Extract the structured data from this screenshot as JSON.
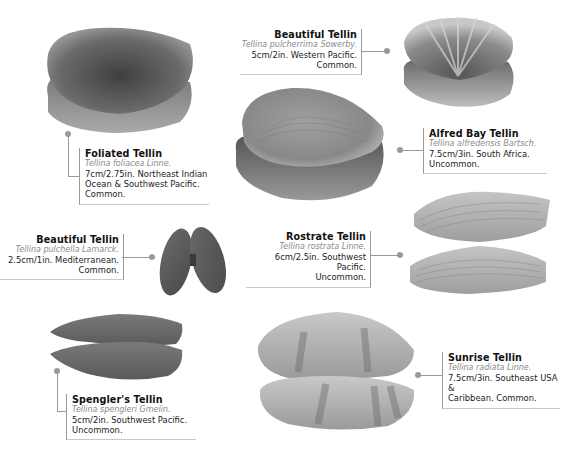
{
  "shells": [
    {
      "id": "foliated-tellin",
      "name": "Foliated Tellin",
      "latin": "Tellina foliacea Linne.",
      "desc_lines": [
        "7cm/2.75in. Northeast Indian",
        "Ocean & Southwest Pacific.",
        "Common."
      ]
    },
    {
      "id": "beautiful-tellin-pulcherrima",
      "name": "Beautiful Tellin",
      "latin": "Tellina pulcherrima Sowerby.",
      "desc_lines": [
        "5cm/2in. Western Pacific.",
        "Common."
      ]
    },
    {
      "id": "alfred-bay-tellin",
      "name": "Alfred Bay Tellin",
      "latin": "Tellina alfredensis Bartsch.",
      "desc_lines": [
        "7.5cm/3in. South Africa.",
        "Uncommon."
      ]
    },
    {
      "id": "beautiful-tellin-pulchella",
      "name": "Beautiful Tellin",
      "latin": "Tellina pulchella Lamarck.",
      "desc_lines": [
        "2.5cm/1in. Mediterranean.",
        "Common."
      ]
    },
    {
      "id": "rostrate-tellin",
      "name": "Rostrate Tellin",
      "latin": "Tellina rostrata Linne.",
      "desc_lines": [
        "6cm/2.5in. Southwest Pacific.",
        "Uncommon."
      ]
    },
    {
      "id": "spenglers-tellin",
      "name": "Spengler's Tellin",
      "latin": "Tellina spengleri Gmelin.",
      "desc_lines": [
        "5cm/2in. Southwest Pacific.",
        "Uncommon."
      ]
    },
    {
      "id": "sunrise-tellin",
      "name": "Sunrise Tellin",
      "latin": "Tellina radiata Linne.",
      "desc_lines": [
        "7.5cm/3in. Southeast USA &",
        "Caribbean. Common."
      ]
    }
  ],
  "colors": {
    "connector": "#9a9a9a",
    "latin_text": "#8a8a8a",
    "body_text": "#222222"
  }
}
